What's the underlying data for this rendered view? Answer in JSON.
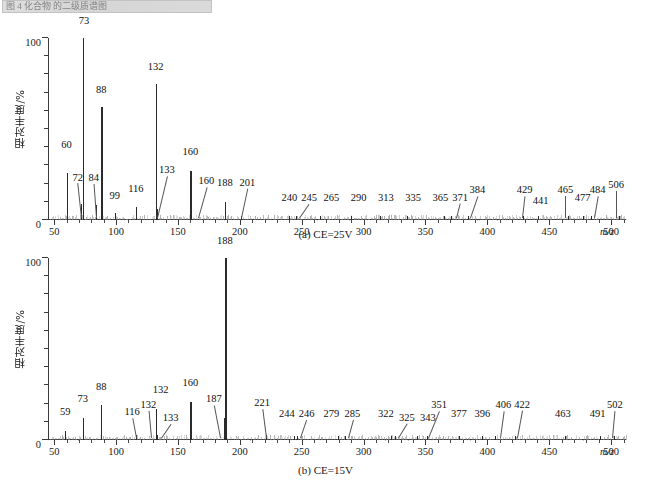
{
  "header": {
    "title_text": "图 4  化合物  的二级质谱图"
  },
  "figure": {
    "y_axis_title": "相对丰度/%",
    "x_axis_title": "m/z",
    "y_ticks": [
      "0",
      "100"
    ],
    "y_min": 0,
    "y_max": 100,
    "x_ticks": [
      "50",
      "100",
      "150",
      "200",
      "250",
      "300",
      "350",
      "400",
      "450",
      "500"
    ],
    "x_min": 45,
    "x_max": 512
  },
  "chart_data": [
    {
      "type": "bar",
      "title": "(a) CE=25V",
      "subtitle": "MS/MS spectrum at collision energy 25 V",
      "xlabel": "m/z",
      "ylabel": "相对丰度/%",
      "xlim": [
        45,
        512
      ],
      "ylim": [
        0,
        100
      ],
      "grid": false,
      "legend": "none",
      "x": [
        60,
        72,
        73,
        84,
        88,
        99,
        116,
        132,
        133,
        160,
        160,
        188,
        201,
        240,
        245,
        265,
        290,
        313,
        335,
        365,
        371,
        384,
        429,
        441,
        465,
        477,
        484,
        506
      ],
      "values": [
        26,
        9,
        100,
        8,
        62,
        4,
        7,
        75,
        6,
        27,
        5,
        10,
        2,
        2,
        2,
        2,
        2,
        2,
        2,
        2,
        2,
        2,
        2,
        2,
        2,
        2,
        2,
        2
      ],
      "labels": [
        "60",
        "72",
        "73",
        "84",
        "88",
        "99",
        "116",
        "132",
        "133",
        "160",
        "160",
        "188",
        "201",
        "240",
        "245",
        "265",
        "290",
        "313",
        "335",
        "365",
        "371",
        "384",
        "429",
        "441",
        "465",
        "477",
        "484",
        "506"
      ]
    },
    {
      "type": "bar",
      "title": "(b) CE=15V",
      "subtitle": "MS/MS spectrum at collision energy 15 V",
      "xlabel": "m/z",
      "ylabel": "相对丰度/%",
      "xlim": [
        45,
        512
      ],
      "ylim": [
        0,
        100
      ],
      "grid": false,
      "legend": "none",
      "x": [
        59,
        73,
        88,
        116,
        132,
        132,
        133,
        160,
        187,
        188,
        221,
        244,
        246,
        279,
        285,
        322,
        325,
        343,
        351,
        377,
        396,
        406,
        422,
        463,
        491,
        502
      ],
      "values": [
        5,
        12,
        19,
        3,
        3,
        17,
        3,
        21,
        12,
        100,
        3,
        2,
        2,
        2,
        2,
        2,
        2,
        2,
        2,
        2,
        2,
        2,
        2,
        2,
        2,
        2
      ],
      "labels": [
        "59",
        "73",
        "88",
        "116",
        "132",
        "132",
        "133",
        "160",
        "187",
        "188",
        "221",
        "244",
        "246",
        "279",
        "285",
        "322",
        "325",
        "343",
        "351",
        "377",
        "396",
        "406",
        "422",
        "463",
        "491",
        "502"
      ]
    }
  ],
  "annotations_a": [
    {
      "label": "60",
      "x": 60,
      "lx": 60,
      "ly": 38,
      "leader": false
    },
    {
      "label": "72",
      "x": 72,
      "lx": 69,
      "ly": 20,
      "leader": true
    },
    {
      "label": "73",
      "x": 73,
      "lx": 74,
      "ly": 106,
      "leader": false
    },
    {
      "label": "84",
      "x": 84,
      "lx": 82,
      "ly": 20,
      "leader": true
    },
    {
      "label": "88",
      "x": 88,
      "lx": 88,
      "ly": 68,
      "leader": false
    },
    {
      "label": "99",
      "x": 99,
      "lx": 99,
      "ly": 10,
      "leader": false
    },
    {
      "label": "116",
      "x": 116,
      "lx": 116,
      "ly": 14,
      "leader": false
    },
    {
      "label": "132",
      "x": 132,
      "lx": 132,
      "ly": 81,
      "leader": false
    },
    {
      "label": "133",
      "x": 133,
      "lx": 141,
      "ly": 24,
      "leader": true
    },
    {
      "label": "160",
      "x": 160,
      "lx": 160,
      "ly": 34,
      "leader": false
    },
    {
      "label": "160",
      "x": 166,
      "lx": 173,
      "ly": 18,
      "leader": true
    },
    {
      "label": "188",
      "x": 188,
      "lx": 188,
      "ly": 17,
      "leader": false
    },
    {
      "label": "201",
      "x": 201,
      "lx": 206,
      "ly": 17,
      "leader": true
    },
    {
      "label": "240",
      "x": 240,
      "lx": 240,
      "ly": 9,
      "leader": false
    },
    {
      "label": "245",
      "x": 248,
      "lx": 256,
      "ly": 9,
      "leader": true
    },
    {
      "label": "265",
      "x": 268,
      "lx": 274,
      "ly": 9,
      "leader": false
    },
    {
      "label": "290",
      "x": 292,
      "lx": 296,
      "ly": 9,
      "leader": false
    },
    {
      "label": "313",
      "x": 315,
      "lx": 318,
      "ly": 9,
      "leader": false
    },
    {
      "label": "335",
      "x": 336,
      "lx": 340,
      "ly": 9,
      "leader": false
    },
    {
      "label": "365",
      "x": 362,
      "lx": 362,
      "ly": 9,
      "leader": false
    },
    {
      "label": "371",
      "x": 375,
      "lx": 378,
      "ly": 9,
      "leader": true
    },
    {
      "label": "384",
      "x": 386,
      "lx": 392,
      "ly": 13,
      "leader": true
    },
    {
      "label": "429",
      "x": 428,
      "lx": 430,
      "ly": 13,
      "leader": true
    },
    {
      "label": "441",
      "x": 440,
      "lx": 443,
      "ly": 7,
      "leader": false
    },
    {
      "label": "465",
      "x": 463,
      "lx": 463,
      "ly": 13,
      "leader": true
    },
    {
      "label": "477",
      "x": 477,
      "lx": 477,
      "ly": 9,
      "leader": false
    },
    {
      "label": "484",
      "x": 486,
      "lx": 489,
      "ly": 13,
      "leader": true
    },
    {
      "label": "506",
      "x": 504,
      "lx": 504,
      "ly": 16,
      "leader": true
    }
  ],
  "annotations_b": [
    {
      "label": "59",
      "x": 59,
      "lx": 59,
      "ly": 12,
      "leader": false
    },
    {
      "label": "73",
      "x": 73,
      "lx": 73,
      "ly": 19,
      "leader": false
    },
    {
      "label": "88",
      "x": 88,
      "lx": 88,
      "ly": 26,
      "leader": false
    },
    {
      "label": "116",
      "x": 116,
      "lx": 113,
      "ly": 12,
      "leader": true
    },
    {
      "label": "132",
      "x": 128,
      "lx": 126,
      "ly": 16,
      "leader": true
    },
    {
      "label": "132",
      "x": 132,
      "lx": 136,
      "ly": 24,
      "leader": false
    },
    {
      "label": "133",
      "x": 136,
      "lx": 144,
      "ly": 9,
      "leader": true
    },
    {
      "label": "160",
      "x": 160,
      "lx": 160,
      "ly": 28,
      "leader": false
    },
    {
      "label": "187",
      "x": 184,
      "lx": 179,
      "ly": 19,
      "leader": true
    },
    {
      "label": "188",
      "x": 188,
      "lx": 188,
      "ly": 106,
      "leader": false
    },
    {
      "label": "221",
      "x": 221,
      "lx": 218,
      "ly": 17,
      "leader": true
    },
    {
      "label": "244",
      "x": 240,
      "lx": 238,
      "ly": 11,
      "leader": false
    },
    {
      "label": "246",
      "x": 249,
      "lx": 254,
      "ly": 11,
      "leader": true
    },
    {
      "label": "279",
      "x": 275,
      "lx": 274,
      "ly": 11,
      "leader": false
    },
    {
      "label": "285",
      "x": 287,
      "lx": 291,
      "ly": 11,
      "leader": true
    },
    {
      "label": "322",
      "x": 318,
      "lx": 318,
      "ly": 11,
      "leader": false
    },
    {
      "label": "325",
      "x": 328,
      "lx": 335,
      "ly": 9,
      "leader": true
    },
    {
      "label": "343",
      "x": 345,
      "lx": 352,
      "ly": 9,
      "leader": false
    },
    {
      "label": "351",
      "x": 352,
      "lx": 361,
      "ly": 16,
      "leader": true
    },
    {
      "label": "377",
      "x": 377,
      "lx": 377,
      "ly": 11,
      "leader": false
    },
    {
      "label": "396",
      "x": 396,
      "lx": 396,
      "ly": 11,
      "leader": false
    },
    {
      "label": "406",
      "x": 410,
      "lx": 413,
      "ly": 16,
      "leader": true
    },
    {
      "label": "422",
      "x": 424,
      "lx": 428,
      "ly": 16,
      "leader": true
    },
    {
      "label": "463",
      "x": 461,
      "lx": 461,
      "ly": 11,
      "leader": false
    },
    {
      "label": "491",
      "x": 489,
      "lx": 489,
      "ly": 11,
      "leader": false
    },
    {
      "label": "502",
      "x": 501,
      "lx": 503,
      "ly": 16,
      "leader": true
    }
  ]
}
